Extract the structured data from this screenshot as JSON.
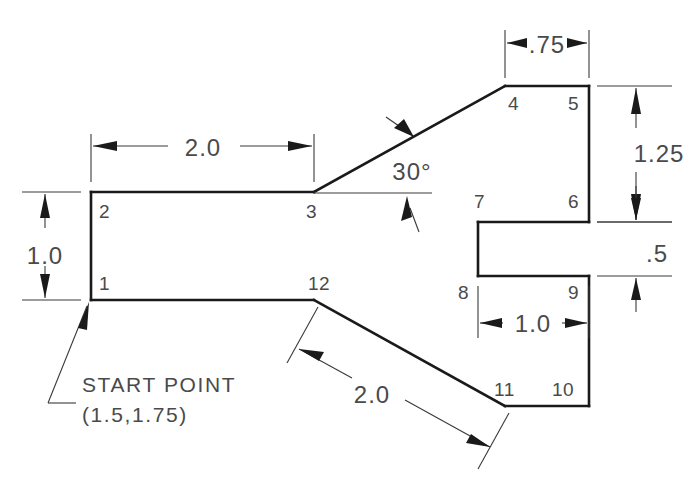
{
  "drawing": {
    "title": "Polyline Profile Dimensioned Sketch",
    "background_color": "#ffffff",
    "object_line_color": "#1a1a1a",
    "dimension_line_color": "#3a3a3a",
    "text_color": "#4a4a4a"
  },
  "vertex_labels": [
    {
      "id": "1",
      "text": "1",
      "x": 99,
      "y": 290
    },
    {
      "id": "2",
      "text": "2",
      "x": 99,
      "y": 218
    },
    {
      "id": "3",
      "text": "3",
      "x": 306,
      "y": 218
    },
    {
      "id": "4",
      "text": "4",
      "x": 508,
      "y": 110
    },
    {
      "id": "5",
      "text": "5",
      "x": 568,
      "y": 110
    },
    {
      "id": "6",
      "text": "6",
      "x": 568,
      "y": 208
    },
    {
      "id": "7",
      "text": "7",
      "x": 474,
      "y": 208
    },
    {
      "id": "8",
      "text": "8",
      "x": 460,
      "y": 299
    },
    {
      "id": "9",
      "text": "9",
      "x": 568,
      "y": 299
    },
    {
      "id": "10",
      "text": "10",
      "x": 556,
      "y": 396
    },
    {
      "id": "11",
      "text": "11",
      "x": 497,
      "y": 396
    },
    {
      "id": "12",
      "text": "12",
      "x": 310,
      "y": 290
    }
  ],
  "dimensions": [
    {
      "id": "width-top-left",
      "value": "2.0",
      "x": 203,
      "y": 152
    },
    {
      "id": "height-left",
      "value": "1.0",
      "x": 45,
      "y": 255
    },
    {
      "id": "angle-slope",
      "value": "30°",
      "x": 412,
      "y": 176
    },
    {
      "id": "width-top-right",
      "value": ".75",
      "x": 547,
      "y": 49
    },
    {
      "id": "height-right",
      "value": "1.25",
      "x": 659,
      "y": 153
    },
    {
      "id": "slot-height",
      "value": ".5",
      "x": 657,
      "y": 257
    },
    {
      "id": "width-slot",
      "value": "1.0",
      "x": 533,
      "y": 329
    },
    {
      "id": "length-diagonal",
      "value": "2.0",
      "x": 372,
      "y": 399
    }
  ],
  "notes": {
    "start_point_label": "START  POINT",
    "start_point_coords": "(1.5,1.75)",
    "start_point_label_x": 82,
    "start_point_label_y": 390,
    "start_point_coords_x": 82,
    "start_point_coords_y": 418
  },
  "geometry": {
    "profile_vertices": [
      {
        "n": "1",
        "x": 91,
        "y": 300
      },
      {
        "n": "2",
        "x": 91,
        "y": 192
      },
      {
        "n": "3",
        "x": 314,
        "y": 192
      },
      {
        "n": "4",
        "x": 505,
        "y": 86
      },
      {
        "n": "5",
        "x": 589,
        "y": 86
      },
      {
        "n": "6",
        "x": 589,
        "y": 222
      },
      {
        "n": "7",
        "x": 478,
        "y": 222
      },
      {
        "n": "8",
        "x": 478,
        "y": 276
      },
      {
        "n": "9",
        "x": 589,
        "y": 276
      },
      {
        "n": "10",
        "x": 589,
        "y": 406
      },
      {
        "n": "11",
        "x": 505,
        "y": 406
      },
      {
        "n": "12",
        "x": 314,
        "y": 300
      }
    ]
  }
}
